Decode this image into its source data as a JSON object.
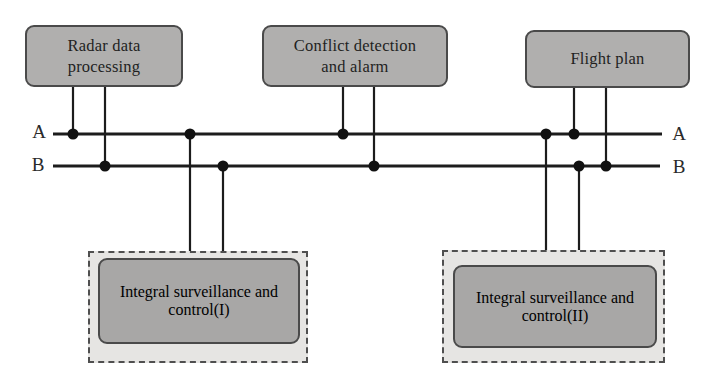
{
  "diagram": {
    "nodes": {
      "radar": {
        "label": "Radar data\nprocessing"
      },
      "conflict": {
        "label": "Conflict detection\nand alarm"
      },
      "flight": {
        "label": "Flight plan"
      },
      "isc1": {
        "label": "Integral surveillance\nand control(I)"
      },
      "isc2": {
        "label": "Integral surveillance\nand control(II)"
      }
    },
    "buses": {
      "a": {
        "label": "A"
      },
      "b": {
        "label": "B"
      }
    },
    "connections": [
      {
        "node": "radar",
        "bus": "A"
      },
      {
        "node": "radar",
        "bus": "B"
      },
      {
        "node": "conflict",
        "bus": "A"
      },
      {
        "node": "conflict",
        "bus": "B"
      },
      {
        "node": "flight",
        "bus": "A"
      },
      {
        "node": "flight",
        "bus": "B"
      },
      {
        "node": "isc1",
        "bus": "A"
      },
      {
        "node": "isc1",
        "bus": "B"
      },
      {
        "node": "isc2",
        "bus": "A"
      },
      {
        "node": "isc2",
        "bus": "B"
      }
    ],
    "colors": {
      "node_fill": "#b0afae",
      "inner_node_fill": "#a8a7a6",
      "container_fill": "#e6e5e3",
      "border": "#4a4a4a",
      "wire": "#1c1c1c",
      "text": "#1f1f1f",
      "background": "#ffffff"
    }
  }
}
